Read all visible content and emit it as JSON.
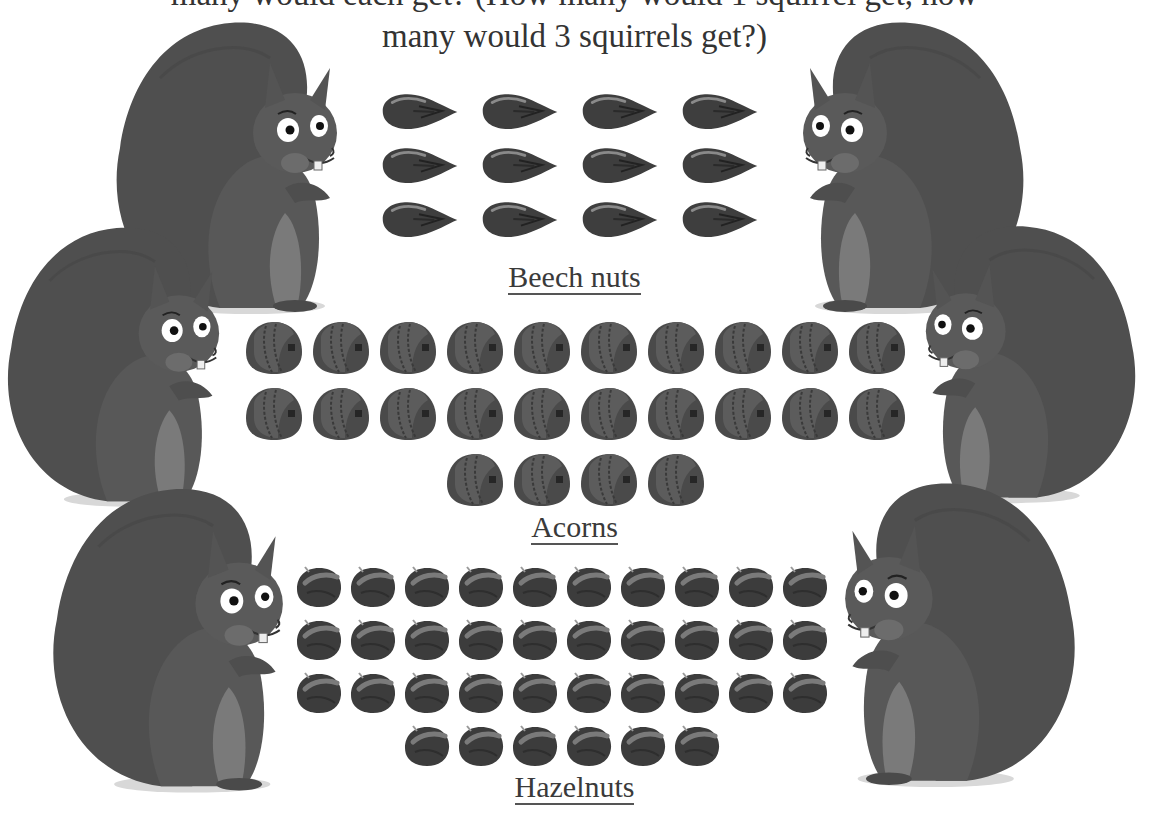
{
  "question": {
    "line1": "many would each get? (How many would 1 squirrel get, how",
    "line2": "many would 3 squirrels get?)"
  },
  "groups": [
    {
      "label": "Beech nuts",
      "count": 12,
      "rows": [
        4,
        4,
        4
      ]
    },
    {
      "label": "Acorns",
      "count": 24,
      "rows": [
        10,
        10,
        4
      ]
    },
    {
      "label": "Hazelnuts",
      "count": 36,
      "rows": [
        10,
        10,
        10,
        6
      ]
    }
  ],
  "squirrels": {
    "count": 6,
    "left": 3,
    "right": 3
  },
  "colors": {
    "fur": "#555555",
    "fur_dark": "#4a4a4a",
    "belly": "#7a7a7a",
    "nut": "#3c3c3c",
    "text": "#3a3a3a"
  }
}
